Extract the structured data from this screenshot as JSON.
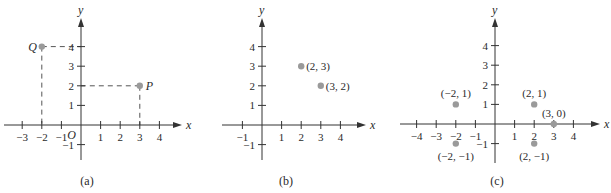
{
  "chart_data": [
    {
      "type": "scatter",
      "panel": "(a)",
      "xlabel": "x",
      "ylabel": "y",
      "origin_label": "O",
      "x_ticks": [
        -3,
        -2,
        -1,
        1,
        2,
        3,
        4
      ],
      "y_ticks": [
        4,
        3,
        2,
        1,
        -1
      ],
      "x_tick_labels": [
        "−3",
        "−2",
        "−1",
        "1",
        "2",
        "3",
        "4"
      ],
      "y_tick_labels": [
        "4",
        "3",
        "2",
        "1",
        "−1"
      ],
      "xlim": [
        -3.9,
        4.9
      ],
      "ylim": [
        -1.7,
        5.3
      ],
      "grid": false,
      "points": [
        {
          "name": "Q",
          "x": -2,
          "y": 4,
          "label": "Q"
        },
        {
          "name": "P",
          "x": 3,
          "y": 2,
          "label": "P"
        }
      ],
      "dashed_projections": true
    },
    {
      "type": "scatter",
      "panel": "(b)",
      "xlabel": "x",
      "ylabel": "y",
      "x_ticks": [
        -1,
        1,
        2,
        3,
        4
      ],
      "y_ticks": [
        4,
        3,
        2,
        1,
        -1
      ],
      "x_tick_labels": [
        "−1",
        "1",
        "2",
        "3",
        "4"
      ],
      "y_tick_labels": [
        "4",
        "3",
        "2",
        "1",
        "−1"
      ],
      "xlim": [
        -1.9,
        4.9
      ],
      "ylim": [
        -1.7,
        5.3
      ],
      "grid": false,
      "points": [
        {
          "x": 2,
          "y": 3,
          "label": "(2, 3)"
        },
        {
          "x": 3,
          "y": 2,
          "label": "(3, 2)"
        }
      ]
    },
    {
      "type": "scatter",
      "panel": "(c)",
      "xlabel": "x",
      "ylabel": "y",
      "x_ticks": [
        -4,
        -3,
        -2,
        -1,
        1,
        2,
        3,
        4
      ],
      "y_ticks": [
        4,
        3,
        2,
        1,
        -1
      ],
      "x_tick_labels": [
        "−4",
        "−3",
        "−2",
        "−1",
        "1",
        "2",
        "3",
        "4"
      ],
      "y_tick_labels": [
        "4",
        "3",
        "2",
        "1",
        "−1"
      ],
      "xlim": [
        -4.9,
        4.9
      ],
      "ylim": [
        -1.7,
        5.3
      ],
      "grid": false,
      "points": [
        {
          "x": -2,
          "y": 1,
          "label": "(−2, 1)"
        },
        {
          "x": 2,
          "y": 1,
          "label": "(2, 1)"
        },
        {
          "x": 3,
          "y": 0,
          "label": "(3, 0)"
        },
        {
          "x": -2,
          "y": -1,
          "label": "(−2, −1)"
        },
        {
          "x": 2,
          "y": -1,
          "label": "(2, −1)"
        }
      ]
    }
  ],
  "style": {
    "axis_color": "#333333",
    "point_color": "#9a9a9a",
    "text_color": "#2a2a2a"
  }
}
